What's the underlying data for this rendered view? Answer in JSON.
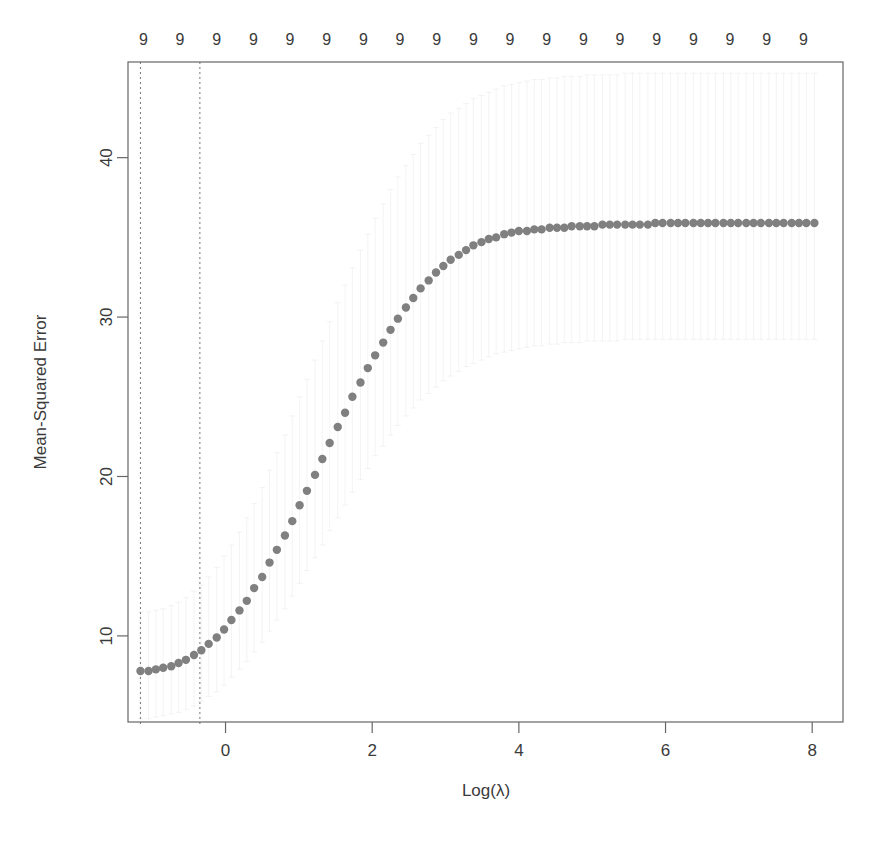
{
  "figure": {
    "width": 872,
    "height": 844,
    "background": "#ffffff"
  },
  "plot_area": {
    "left": 128,
    "right": 843,
    "top": 62,
    "bottom": 722
  },
  "axes": {
    "x_label": "Log(λ)",
    "y_label": "Mean-Squared Error",
    "x_ticks": [
      0,
      2,
      4,
      6,
      8
    ],
    "x_tick_labels": [
      "0",
      "2",
      "4",
      "6",
      "8"
    ],
    "y_ticks": [
      10,
      20,
      30,
      40
    ],
    "y_tick_labels": [
      "10",
      "20",
      "30",
      "40"
    ],
    "xlim": [
      -1.33,
      8.42
    ],
    "ylim": [
      4.6,
      46.0
    ],
    "grid": false
  },
  "top_axis": {
    "label": "number-of-nonzero-coefficients",
    "values": [
      "9",
      "9",
      "9",
      "9",
      "9",
      "9",
      "9",
      "9",
      "9",
      "9",
      "9",
      "9",
      "9",
      "9",
      "9",
      "9",
      "9",
      "9",
      "9"
    ],
    "x_positions": [
      -1.12,
      -0.62,
      -0.12,
      0.38,
      0.88,
      1.38,
      1.88,
      2.38,
      2.88,
      3.38,
      3.88,
      4.38,
      4.88,
      5.38,
      5.88,
      6.38,
      6.88,
      7.38,
      7.88
    ]
  },
  "vertical_lines": [
    {
      "name": "lambda-min",
      "x": -1.16,
      "style": "dotted",
      "color": "#808080"
    },
    {
      "name": "lambda-1se",
      "x": -0.35,
      "style": "dotted",
      "color": "#808080"
    }
  ],
  "style": {
    "point_color": "#808080",
    "point_radius": 4.2,
    "frame_color": "#666666",
    "errorbar_color": "#bfbfbf",
    "text_color": "#3a3a3a"
  },
  "chart_data": {
    "type": "scatter",
    "title": "",
    "subtitle": "",
    "xlabel": "Log(λ)",
    "ylabel": "Mean-Squared Error",
    "xlim": [
      -1.33,
      8.42
    ],
    "ylim": [
      4.6,
      46.0
    ],
    "grid": false,
    "legend": "none",
    "annotations": [
      "vertical dotted line at Log(lambda) = -1.16 (lambda.min)",
      "vertical dotted line at Log(lambda) = -0.35 (lambda.1se)",
      "top axis shows 9 nonzero coefficients at every lambda"
    ],
    "series": [
      {
        "name": "Mean-Squared Error (CV)",
        "marker": "filled-circle",
        "color": "#808080",
        "x": [
          -1.16,
          -1.05,
          -0.95,
          -0.85,
          -0.74,
          -0.64,
          -0.54,
          -0.43,
          -0.33,
          -0.23,
          -0.12,
          -0.02,
          0.08,
          0.19,
          0.29,
          0.39,
          0.5,
          0.6,
          0.7,
          0.81,
          0.91,
          1.01,
          1.11,
          1.22,
          1.32,
          1.42,
          1.53,
          1.63,
          1.73,
          1.84,
          1.94,
          2.04,
          2.15,
          2.25,
          2.35,
          2.46,
          2.56,
          2.66,
          2.77,
          2.87,
          2.97,
          3.07,
          3.18,
          3.28,
          3.38,
          3.49,
          3.59,
          3.69,
          3.8,
          3.9,
          4.0,
          4.11,
          4.21,
          4.31,
          4.42,
          4.52,
          4.62,
          4.72,
          4.83,
          4.93,
          5.03,
          5.14,
          5.24,
          5.34,
          5.45,
          5.55,
          5.65,
          5.76,
          5.86,
          5.96,
          6.07,
          6.17,
          6.27,
          6.38,
          6.48,
          6.58,
          6.68,
          6.79,
          6.89,
          6.99,
          7.1,
          7.2,
          7.3,
          7.41,
          7.51,
          7.61,
          7.72,
          7.82,
          7.92,
          8.03
        ],
        "y": [
          7.8,
          7.8,
          7.9,
          8.0,
          8.1,
          8.3,
          8.5,
          8.8,
          9.1,
          9.5,
          9.9,
          10.4,
          11.0,
          11.6,
          12.2,
          13.0,
          13.7,
          14.6,
          15.4,
          16.3,
          17.2,
          18.2,
          19.1,
          20.1,
          21.1,
          22.1,
          23.1,
          24.0,
          25.0,
          25.9,
          26.8,
          27.6,
          28.4,
          29.2,
          29.9,
          30.6,
          31.2,
          31.8,
          32.3,
          32.8,
          33.2,
          33.6,
          33.9,
          34.2,
          34.5,
          34.7,
          34.9,
          35.0,
          35.2,
          35.3,
          35.4,
          35.4,
          35.5,
          35.5,
          35.6,
          35.6,
          35.6,
          35.7,
          35.7,
          35.7,
          35.7,
          35.8,
          35.8,
          35.8,
          35.8,
          35.8,
          35.8,
          35.8,
          35.9,
          35.9,
          35.9,
          35.9,
          35.9,
          35.9,
          35.9,
          35.9,
          35.9,
          35.9,
          35.9,
          35.9,
          35.9,
          35.9,
          35.9,
          35.9,
          35.9,
          35.9,
          35.9,
          35.9,
          35.9,
          35.9
        ],
        "y_upper": [
          11.5,
          11.5,
          11.6,
          11.7,
          11.9,
          12.1,
          12.4,
          12.8,
          13.2,
          13.7,
          14.3,
          15.0,
          15.7,
          16.5,
          17.4,
          18.3,
          19.3,
          20.4,
          21.5,
          22.6,
          23.8,
          25.0,
          26.1,
          27.3,
          28.5,
          29.7,
          30.9,
          32.0,
          33.1,
          34.2,
          35.2,
          36.2,
          37.1,
          38.0,
          38.8,
          39.5,
          40.2,
          40.9,
          41.4,
          41.9,
          42.4,
          42.8,
          43.1,
          43.4,
          43.7,
          43.9,
          44.1,
          44.3,
          44.5,
          44.6,
          44.7,
          44.8,
          44.9,
          44.9,
          45.0,
          45.0,
          45.1,
          45.1,
          45.1,
          45.2,
          45.2,
          45.2,
          45.2,
          45.2,
          45.3,
          45.3,
          45.3,
          45.3,
          45.3,
          45.3,
          45.3,
          45.3,
          45.3,
          45.3,
          45.3,
          45.3,
          45.3,
          45.3,
          45.3,
          45.3,
          45.3,
          45.3,
          45.3,
          45.3,
          45.3,
          45.3,
          45.3,
          45.3,
          45.3,
          45.3
        ],
        "y_lower": [
          4.8,
          4.8,
          4.9,
          5.0,
          5.1,
          5.2,
          5.4,
          5.6,
          5.9,
          6.2,
          6.5,
          6.9,
          7.4,
          7.9,
          8.4,
          9.0,
          9.6,
          10.3,
          11.0,
          11.7,
          12.5,
          13.3,
          14.1,
          14.9,
          15.7,
          16.6,
          17.4,
          18.2,
          19.0,
          19.8,
          20.5,
          21.3,
          21.9,
          22.6,
          23.2,
          23.8,
          24.3,
          24.8,
          25.2,
          25.6,
          26.0,
          26.3,
          26.6,
          26.9,
          27.1,
          27.3,
          27.5,
          27.7,
          27.8,
          27.9,
          28.0,
          28.1,
          28.2,
          28.2,
          28.3,
          28.3,
          28.4,
          28.4,
          28.4,
          28.5,
          28.5,
          28.5,
          28.5,
          28.5,
          28.6,
          28.6,
          28.6,
          28.6,
          28.6,
          28.6,
          28.6,
          28.6,
          28.6,
          28.6,
          28.6,
          28.6,
          28.6,
          28.6,
          28.6,
          28.6,
          28.6,
          28.6,
          28.6,
          28.6,
          28.6,
          28.6,
          28.6,
          28.6,
          28.6,
          28.6
        ]
      }
    ]
  }
}
